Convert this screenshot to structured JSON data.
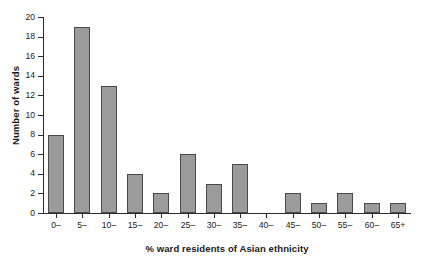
{
  "chart_data": {
    "type": "bar",
    "title": "",
    "xlabel": "% ward residents of Asian ethnicity",
    "ylabel": "Number of wards",
    "categories": [
      "0–",
      "5–",
      "10–",
      "15–",
      "20–",
      "25–",
      "30–",
      "35–",
      "40–",
      "45–",
      "50–",
      "55–",
      "60–",
      "65+"
    ],
    "values": [
      8,
      19,
      13,
      4,
      2,
      6,
      3,
      5,
      0,
      2,
      1,
      2,
      1,
      1
    ],
    "ylim": [
      0,
      20
    ],
    "ytick_labels": [
      "0",
      "2",
      "4",
      "6",
      "8",
      "10",
      "12",
      "14",
      "16",
      "18",
      "20"
    ],
    "ytick_values": [
      0,
      2,
      4,
      6,
      8,
      10,
      12,
      14,
      16,
      18,
      20
    ],
    "grid": false,
    "legend": null,
    "bar_color": "#9b9b9b",
    "bar_edge_color": "#4a4a4a",
    "axis_color": "#2b2b2b",
    "background": "#ffffff"
  }
}
